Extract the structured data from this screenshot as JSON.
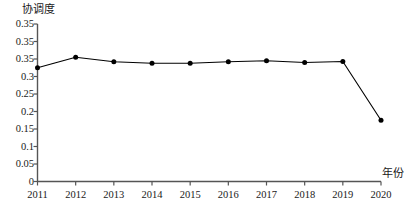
{
  "chart_data": {
    "type": "line",
    "title": "",
    "xlabel": "年份",
    "ylabel": "协调度",
    "x": [
      2011,
      2012,
      2013,
      2014,
      2015,
      2016,
      2017,
      2018,
      2019,
      2020
    ],
    "categories": [
      "2011",
      "2012",
      "2013",
      "2014",
      "2015",
      "2016",
      "2017",
      "2018",
      "2019",
      "2020"
    ],
    "values": [
      0.325,
      0.355,
      0.342,
      0.338,
      0.338,
      0.342,
      0.345,
      0.34,
      0.343,
      0.175
    ],
    "series": [
      {
        "name": "协调度",
        "values": [
          0.325,
          0.355,
          0.342,
          0.338,
          0.338,
          0.342,
          0.345,
          0.34,
          0.343,
          0.175
        ]
      }
    ],
    "ylim": [
      0,
      0.45
    ],
    "xlim": [
      2011,
      2020
    ],
    "y_tick_values": [
      0.45,
      0.4,
      0.35,
      0.3,
      0.25,
      0.2,
      0.15,
      0.1,
      0.05,
      0
    ],
    "y_tick_labels": [
      "0.35",
      "0.35",
      "0.35",
      "0.3",
      "0.25",
      "0.2",
      "0.15",
      "0.1",
      "0.05",
      "0"
    ],
    "x_tick_labels": [
      "2011",
      "2012",
      "2013",
      "2014",
      "2015",
      "2016",
      "2017",
      "2018",
      "2019",
      "2020"
    ],
    "grid": false,
    "legend": "none",
    "marker": "filled-circle",
    "line_color": "#000000",
    "marker_color": "#000000",
    "axis_color": "#555555"
  }
}
